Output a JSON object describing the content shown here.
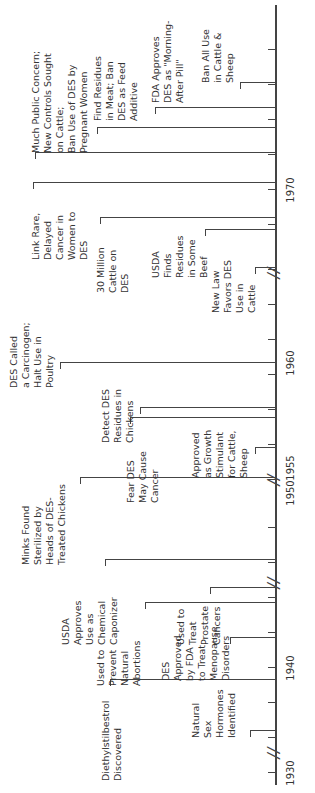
{
  "axis": {
    "years": [
      {
        "label": "1930",
        "x": 20
      },
      {
        "label": "1940",
        "x": 125
      },
      {
        "label": "1950",
        "x": 300
      },
      {
        "label": "1955",
        "x": 325
      },
      {
        "label": "1960",
        "x": 430
      },
      {
        "label": "1970",
        "x": 603
      }
    ],
    "ticks": [
      20,
      55,
      90,
      125,
      160,
      195,
      230,
      265,
      313,
      348,
      383,
      418,
      453,
      488,
      523,
      568,
      603,
      638,
      673,
      708,
      743
    ],
    "breaks": [
      40,
      210,
      313,
      520
    ]
  },
  "events": [
    {
      "text": "Natural\nSex\nHormones\nIdentified",
      "x": 55,
      "y": 190,
      "lx": 62,
      "ly1": 250,
      "ly2": 275
    },
    {
      "text": "Diethylstilbestrol\nDiscovered",
      "x": 12,
      "y": 100,
      "lx": 113,
      "ly1": 110,
      "ly2": 275
    },
    {
      "text": "DES\nApproved\nby FDA\nto Treat\nMenopause\nDisorders",
      "x": 112,
      "y": 160,
      "lx": 155,
      "ly1": 230,
      "ly2": 275
    },
    {
      "text": "Used to\nPrevent\nNatural\nAbortions",
      "x": 107,
      "y": 95,
      "lx": 190,
      "ly1": 145,
      "ly2": 275
    },
    {
      "text": "Used to\nTreat\nProstate\nCancers",
      "x": 148,
      "y": 175,
      "lx": 205,
      "ly1": 210,
      "ly2": 275
    },
    {
      "text": "USDA\nApproves\nUse as\nChemical\nCaponizer",
      "x": 148,
      "y": 60,
      "lx": 233,
      "ly1": 105,
      "ly2": 275
    },
    {
      "text": "Minks Found\nSterilized by\nHeads of DES-\nTreated Chickens",
      "x": 228,
      "y": 20,
      "lx": 315,
      "ly1": 80,
      "ly2": 275
    },
    {
      "text": "Fear DES\nMay Cause\nCancer",
      "x": 290,
      "y": 125,
      "lx": 375,
      "ly1": 130,
      "ly2": 275
    },
    {
      "text": "Approved\nas Growth\nStimulant\nfor Cattle,\nSheep",
      "x": 315,
      "y": 190,
      "lx": 345,
      "ly1": 255,
      "ly2": 275
    },
    {
      "text": "Detect DES\nResidues in\nChickens",
      "x": 350,
      "y": 100,
      "lx": 385,
      "ly1": 140,
      "ly2": 275
    },
    {
      "text": "DES Called\na Carcinogen;\nHalt Use in\nPoultry",
      "x": 405,
      "y": 8,
      "lx": 430,
      "ly1": 60,
      "ly2": 275
    },
    {
      "text": "New Law\nFavors DES\nUse in\nCattle",
      "x": 480,
      "y": 210,
      "lx": 525,
      "ly1": 255,
      "ly2": 275
    },
    {
      "text": "USDA\nFinds\nResidues\nin Some\nBeef",
      "x": 515,
      "y": 150,
      "lx": 563,
      "ly1": 205,
      "ly2": 275
    },
    {
      "text": "30 Million\nCattle on\nDES",
      "x": 500,
      "y": 95,
      "lx": 575,
      "ly1": 100,
      "ly2": 275
    },
    {
      "text": "Link Rare,\nDelayed\nCancer in\nWomen to\nDES",
      "x": 533,
      "y": 30,
      "lx": 610,
      "ly1": 33,
      "ly2": 275
    },
    {
      "text": "Much Public Concern;\nNew Controls Sought\non Cattle;\nBan Use of DES by\nPregnant Women",
      "x": 640,
      "y": 30,
      "lx": 640,
      "ly1": 35,
      "ly2": 275
    },
    {
      "text": "Find Residues\nin Meat; Ban\nDES as Feed\nAdditive",
      "x": 672,
      "y": 92,
      "lx": 665,
      "ly1": 97,
      "ly2": 275
    },
    {
      "text": "FDA Approves\nDES as \"Morning-\nAfter Pill\"",
      "x": 690,
      "y": 150,
      "lx": 685,
      "ly1": 155,
      "ly2": 275
    },
    {
      "text": "Ban All Use\nin Cattle &\nSheep",
      "x": 710,
      "y": 200,
      "lx": 710,
      "ly1": 240,
      "ly2": 275
    }
  ]
}
